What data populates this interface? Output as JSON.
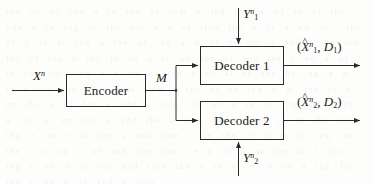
{
  "diagram": {
    "type": "block-diagram",
    "background_artifact_text": "the on of ion a re the of orm n ing the a nd to of the one s in ing ar the for a s of tion the n is a nd of  the of e in at ion a the of ing a n of re the s and a on the for of the n the to in a re on the of ing the s an a of in the for tion e a nd of the s on at re the of ing a n in e for the of s and tion a the of re ing n at the in a on the s of for e and a tion the of n re at ing the s in a for of on the e and the a tion of s n re at in the for ing a on e of the s and tion a re the of n at in ing for the s a on e of and the tion re a of n at the in s for ing e on a of the and tion the s re at of n in a ing for the e on s of and a tion",
    "stroke_color": "#2a2a2a",
    "text_color": "#1b1b1b"
  },
  "blocks": [
    {
      "id": "encoder",
      "label": "Encoder"
    },
    {
      "id": "decoder1",
      "label": "Decoder 1"
    },
    {
      "id": "decoder2",
      "label": "Decoder 2"
    }
  ],
  "signals": {
    "source_input": {
      "base": "X",
      "sup": "n",
      "sub": ""
    },
    "message": {
      "base": "M",
      "sup": "",
      "sub": ""
    },
    "side_info_1": {
      "base": "Y",
      "sup": "n",
      "sub": "1"
    },
    "side_info_2": {
      "base": "Y",
      "sup": "n",
      "sub": "2"
    },
    "output_1": {
      "open": "(",
      "hat": "^",
      "base": "X",
      "sup": "n",
      "sub": "1",
      "comma": ", ",
      "distortion_base": "D",
      "distortion_sub": "1",
      "close": ")"
    },
    "output_2": {
      "open": "(",
      "hat": "^",
      "base": "X",
      "sup": "n",
      "sub": "2",
      "comma": ", ",
      "distortion_base": "D",
      "distortion_sub": "2",
      "close": ")"
    }
  }
}
